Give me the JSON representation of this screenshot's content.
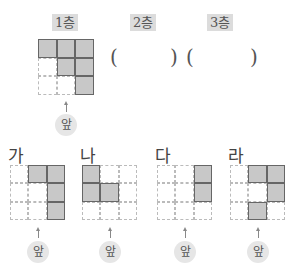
{
  "floors": [
    {
      "label": "1층",
      "x": 52
    },
    {
      "label": "2층",
      "x": 130
    },
    {
      "label": "3층",
      "x": 207
    }
  ],
  "answer_blanks": [
    {
      "open": "(",
      "close": ")",
      "open_x": 110,
      "close_x": 170
    },
    {
      "open": "(",
      "close": ")",
      "open_x": 186,
      "close_x": 250
    }
  ],
  "front_label": "앞",
  "top_view": {
    "x": 38,
    "y": 39,
    "size": 56,
    "cells": [
      1,
      1,
      1,
      0,
      1,
      1,
      0,
      0,
      1
    ]
  },
  "options": [
    {
      "label": "가",
      "x": 10,
      "cells": [
        0,
        1,
        1,
        0,
        0,
        1,
        0,
        0,
        1
      ]
    },
    {
      "label": "나",
      "x": 82,
      "cells": [
        1,
        0,
        0,
        1,
        1,
        0,
        0,
        0,
        0
      ]
    },
    {
      "label": "다",
      "x": 157,
      "cells": [
        0,
        0,
        1,
        0,
        0,
        1,
        0,
        0,
        0
      ]
    },
    {
      "label": "라",
      "x": 230,
      "cells": [
        0,
        1,
        1,
        0,
        0,
        1,
        0,
        1,
        0
      ]
    }
  ]
}
